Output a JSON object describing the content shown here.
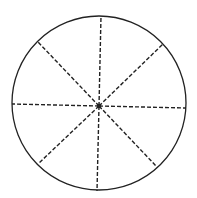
{
  "diagram": {
    "type": "circle-divided-into-sectors",
    "sector_count": 8,
    "colors": {
      "background": "#ffffff",
      "stroke": "#222222"
    },
    "circle": {
      "cx": 99,
      "cy": 103,
      "r": 87
    },
    "center_point": {
      "x": 99,
      "y": 106
    },
    "spokes": [
      {
        "name": "top",
        "x": 101,
        "y": 16
      },
      {
        "name": "top-right",
        "x": 163,
        "y": 44
      },
      {
        "name": "right",
        "x": 186,
        "y": 108
      },
      {
        "name": "bottom-right",
        "x": 157,
        "y": 167
      },
      {
        "name": "bottom",
        "x": 97,
        "y": 191
      },
      {
        "name": "bottom-left",
        "x": 38,
        "y": 164
      },
      {
        "name": "left",
        "x": 12,
        "y": 104
      },
      {
        "name": "top-left",
        "x": 38,
        "y": 42
      }
    ],
    "spoke_style": "dashed"
  }
}
